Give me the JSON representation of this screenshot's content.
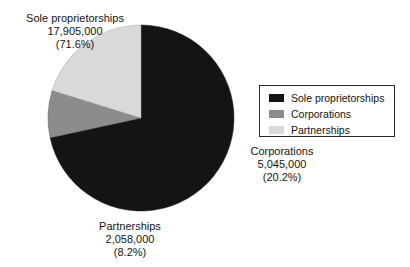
{
  "chart_data": {
    "type": "pie",
    "title": "",
    "subtitle": "",
    "xlabel": "",
    "ylabel": "",
    "legend_position": "right",
    "grid": false,
    "total": 25008000,
    "start_angle_deg": 0,
    "direction": "clockwise",
    "categories": [
      "Sole proprietorships",
      "Corporations",
      "Partnerships"
    ],
    "values": [
      17905000,
      5045000,
      2058000
    ],
    "percentages": [
      71.6,
      20.2,
      8.2
    ],
    "value_labels": [
      "17,905,000",
      "5,045,000",
      "2,058,000"
    ],
    "percent_labels": [
      "(71.6%)",
      "(20.2%)",
      "(8.2%)"
    ],
    "colors": [
      "#141414",
      "#8c8c8c",
      "#d9d9d9"
    ],
    "slices": [
      {
        "name": "Sole proprietorships",
        "value": 17905000,
        "value_label": "17,905,000",
        "percent": 71.6,
        "percent_label": "(71.6%)",
        "color": "#141414",
        "sweep_deg": 257.8
      },
      {
        "name": "Corporations",
        "value": 5045000,
        "value_label": "5,045,000",
        "percent": 20.2,
        "percent_label": "(20.2%)",
        "color": "#d9d9d9",
        "sweep_deg": 72.7
      },
      {
        "name": "Partnerships",
        "value": 2058000,
        "value_label": "2,058,000",
        "percent": 8.2,
        "percent_label": "(8.2%)",
        "color": "#8c8c8c",
        "sweep_deg": 29.5
      }
    ]
  },
  "callouts": {
    "sole": {
      "name": "Sole proprietorships",
      "value": "17,905,000",
      "percent": "(71.6%)"
    },
    "corporations": {
      "name": "Corporations",
      "value": "5,045,000",
      "percent": "(20.2%)"
    },
    "partnerships": {
      "name": "Partnerships",
      "value": "2,058,000",
      "percent": "(8.2%)"
    }
  },
  "legend": {
    "items": [
      {
        "label": "Sole proprietorships",
        "color": "#141414",
        "swatch_icon": "legend-swatch-black"
      },
      {
        "label": "Corporations",
        "color": "#8c8c8c",
        "swatch_icon": "legend-swatch-gray"
      },
      {
        "label": "Partnerships",
        "color": "#d9d9d9",
        "swatch_icon": "legend-swatch-light-gray"
      }
    ]
  },
  "geometry": {
    "center_x": 141,
    "center_y": 118,
    "radius": 93
  }
}
